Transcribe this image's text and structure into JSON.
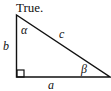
{
  "title": "True.",
  "triangle": {
    "labels": {
      "hypotenuse": "c",
      "vertical_leg": "b",
      "horizontal_leg": "a",
      "top_angle": "α",
      "right_angle_vertex_opposite_angle": "β"
    },
    "right_angle_marker": true
  }
}
